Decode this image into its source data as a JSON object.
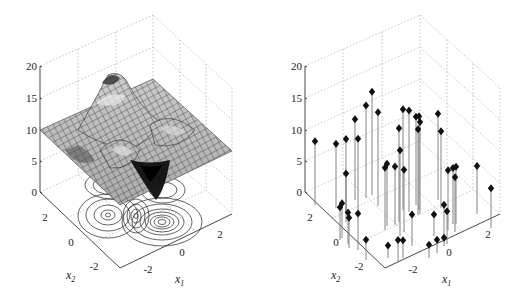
{
  "chart_data": [
    {
      "type": "surface",
      "panel": "left",
      "title": "",
      "xlabel": "x1",
      "ylabel": "x2",
      "zlabel": "",
      "x_ticks": [
        "-2",
        "0",
        "2"
      ],
      "y_ticks": [
        "-2",
        "0",
        "2"
      ],
      "z_ticks": [
        "0",
        "5",
        "10",
        "15",
        "20"
      ],
      "xlim": [
        -3,
        3
      ],
      "ylim": [
        -3,
        3
      ],
      "zlim": [
        0,
        20
      ],
      "grid": true,
      "baseline_z": 10,
      "description": "peaks-like mesh surface (offset +10) with contour lines projected onto the floor plane",
      "features": [
        {
          "kind": "peak",
          "x1": -0.5,
          "x2": 1.6,
          "z": 18
        },
        {
          "kind": "peak",
          "x1": -0.2,
          "x2": -0.6,
          "z": 13.5
        },
        {
          "kind": "peak",
          "x1": 1.5,
          "x2": 1.2,
          "z": 12
        },
        {
          "kind": "trough",
          "x1": 0.3,
          "x2": -1.6,
          "z": 3.5
        },
        {
          "kind": "trough",
          "x1": -1.6,
          "x2": 0.1,
          "z": 6.5
        }
      ],
      "contours": {
        "projected_to": "floor",
        "levels_visible": true
      }
    },
    {
      "type": "stem3",
      "panel": "right",
      "title": "",
      "xlabel": "x1",
      "ylabel": "x2",
      "zlabel": "",
      "x_ticks": [
        "-2",
        "0",
        "2"
      ],
      "y_ticks": [
        "-2",
        "0",
        "2"
      ],
      "z_ticks": [
        "0",
        "5",
        "10",
        "15",
        "20"
      ],
      "xlim": [
        -3,
        3
      ],
      "ylim": [
        -3,
        3
      ],
      "zlim": [
        0,
        20
      ],
      "grid": true,
      "marker": "diamond",
      "description": "scattered samples of the surface shown as vertical stems with filled diamond markers",
      "points_approx_z": [
        10.1,
        10.2,
        11.6,
        7.7,
        12.8,
        11.3,
        14.7,
        16.4,
        14.9,
        9.9,
        9.9,
        9.3,
        14.9,
        13.6,
        16.0,
        16.1,
        9.9,
        14.0,
        13.6,
        14.9,
        14.6,
        13.7,
        12.2,
        9.5,
        8.9,
        8.7,
        9.1,
        7.6,
        5.2,
        5.5,
        5.0,
        4.8,
        5.8,
        3.2,
        2.0,
        3.5,
        2.8,
        3.4,
        5.6,
        5.2,
        5.0,
        2.1,
        2.1,
        1.3,
        6.3
      ]
    }
  ],
  "panels": {
    "left": {
      "z_ticks": [
        "0",
        "5",
        "10",
        "15",
        "20"
      ],
      "x1_ticks": [
        "-2",
        "0",
        "2"
      ],
      "x2_ticks": [
        "2",
        "0",
        "-2"
      ],
      "x1_label": "x",
      "x1_sub": "1",
      "x2_label": "x",
      "x2_sub": "2"
    },
    "right": {
      "z_ticks": [
        "0",
        "5",
        "10",
        "15",
        "20"
      ],
      "x1_ticks": [
        "-2",
        "0",
        "2"
      ],
      "x2_ticks": [
        "2",
        "0",
        "-2"
      ],
      "x1_label": "x",
      "x1_sub": "1",
      "x2_label": "x",
      "x2_sub": "2"
    }
  }
}
